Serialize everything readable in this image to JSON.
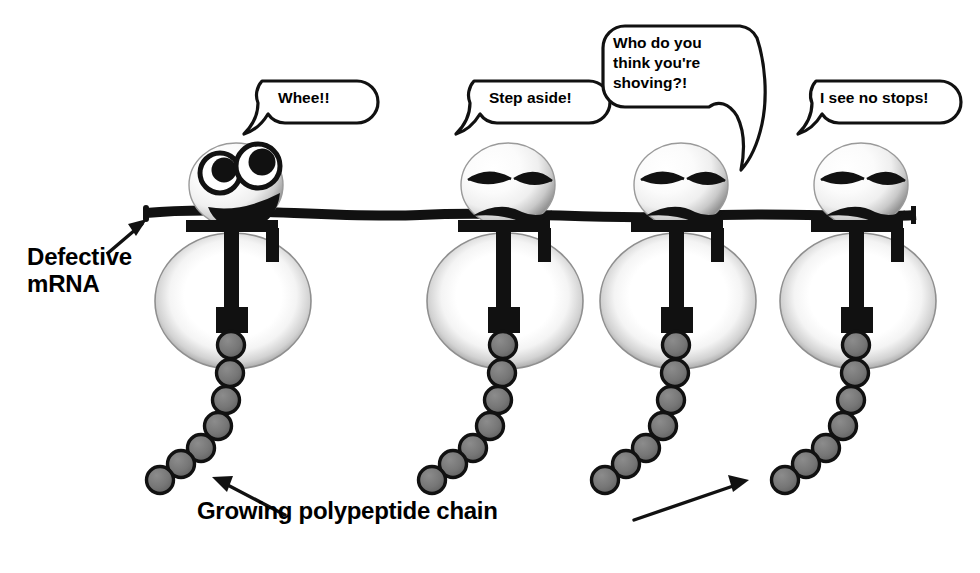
{
  "figure": {
    "background_color": "#ffffff",
    "ink_color": "#000000",
    "subunit_gray": "#8a8a8a",
    "bead_gray": "#6f6f6f"
  },
  "labels": {
    "defective_mrna": "Defective\nmRNA",
    "growing_chain": "Growing polypeptide chain"
  },
  "speech_bubbles": [
    {
      "id": "bubble-1",
      "text": "Whee!!",
      "speaker": "ribosome-1"
    },
    {
      "id": "bubble-2",
      "text": "Step aside!",
      "speaker": "ribosome-2"
    },
    {
      "id": "bubble-3",
      "text": "Who do you\nthink you're\nshoving?!",
      "speaker": "ribosome-3"
    },
    {
      "id": "bubble-4",
      "text": "I see no stops!",
      "speaker": "ribosome-4"
    }
  ],
  "ribosomes": [
    {
      "id": "ribosome-1",
      "expression": "happy",
      "bead_count": 7
    },
    {
      "id": "ribosome-2",
      "expression": "grumpy",
      "bead_count": 7
    },
    {
      "id": "ribosome-3",
      "expression": "grumpy",
      "bead_count": 7
    },
    {
      "id": "ribosome-4",
      "expression": "grumpy",
      "bead_count": 7
    }
  ],
  "annotations": {
    "mrna_arrow": "arrow pointing to mRNA strand",
    "chain_arrow_left": "arrow pointing up-left to polypeptide chain",
    "chain_arrow_right": "arrow pointing up-right to polypeptide chain"
  }
}
